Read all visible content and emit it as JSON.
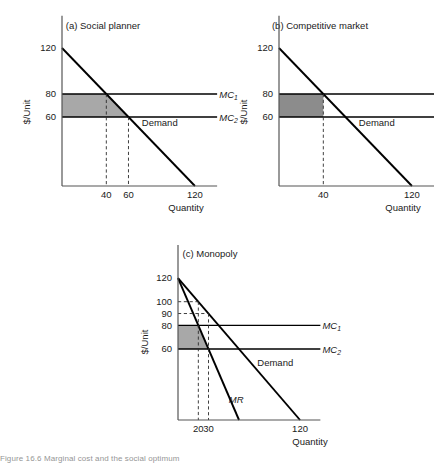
{
  "figure": {
    "caption_fragment": "Figure 16.6  Marginal cost and the social optimum"
  },
  "common": {
    "y_axis_title": "$/Unit",
    "x_axis_title": "Quantity",
    "label_mc1": "MC",
    "label_mc1_sub": "1",
    "label_mc2": "MC",
    "label_mc2_sub": "2",
    "label_demand": "Demand",
    "label_mr": "MR"
  },
  "chart_data": [
    {
      "id": "a",
      "type": "line",
      "title": "(a) Social planner",
      "xlabel": "Quantity",
      "ylabel": "$/Unit",
      "xlim": [
        0,
        140
      ],
      "ylim": [
        0,
        140
      ],
      "x_ticks": [
        40,
        60,
        120
      ],
      "x_tick_labels": [
        "40",
        "60",
        "120"
      ],
      "y_ticks": [
        60,
        80,
        120
      ],
      "y_tick_labels": [
        "60",
        "80",
        "120"
      ],
      "grid": false,
      "legend": "inline-labels",
      "series": [
        {
          "name": "Demand",
          "type": "line",
          "points": [
            [
              0,
              120
            ],
            [
              120,
              0
            ]
          ],
          "label": "Demand",
          "label_at": [
            72,
            52
          ]
        },
        {
          "name": "MC1",
          "type": "horizontal-line",
          "value": 80,
          "x_from": 0,
          "x_to": 140,
          "label": "MC1",
          "label_at": [
            142,
            80
          ]
        },
        {
          "name": "MC2",
          "type": "horizontal-line",
          "value": 60,
          "x_from": 0,
          "x_to": 140,
          "label": "MC2",
          "label_at": [
            142,
            60
          ]
        }
      ],
      "shaded_region": {
        "description": "Deadweight/benefit area between MC1 and MC2 bounded by demand",
        "fill": "#a8a8a8",
        "vertices": [
          [
            0,
            80
          ],
          [
            40,
            80
          ],
          [
            60,
            60
          ],
          [
            0,
            60
          ]
        ]
      },
      "dashed_drops": [
        {
          "x": 40,
          "from_y": 80,
          "to_y": 0
        },
        {
          "x": 60,
          "from_y": 60,
          "to_y": 0
        }
      ]
    },
    {
      "id": "b",
      "type": "line",
      "title": "(b) Competitive market",
      "xlabel": "Quantity",
      "ylabel": "$/Unit",
      "xlim": [
        0,
        140
      ],
      "ylim": [
        0,
        140
      ],
      "x_ticks": [
        40,
        120
      ],
      "x_tick_labels": [
        "40",
        "120"
      ],
      "y_ticks": [
        60,
        80,
        120
      ],
      "y_tick_labels": [
        "60",
        "80",
        "120"
      ],
      "grid": false,
      "legend": "inline-labels",
      "series": [
        {
          "name": "Demand",
          "type": "line",
          "points": [
            [
              0,
              120
            ],
            [
              120,
              0
            ]
          ],
          "label": "Demand",
          "label_at": [
            72,
            52
          ]
        },
        {
          "name": "MC1",
          "type": "horizontal-line",
          "value": 80,
          "x_from": 0,
          "x_to": 140,
          "label": "MC1",
          "label_at": [
            142,
            80
          ]
        },
        {
          "name": "MC2",
          "type": "horizontal-line",
          "value": 60,
          "x_from": 0,
          "x_to": 140,
          "label": "MC2",
          "label_at": [
            142,
            60
          ]
        }
      ],
      "shaded_region": {
        "description": "Producer cost-saving rectangle at competitive quantity 40",
        "fill": "#8c8c8c",
        "vertices": [
          [
            0,
            80
          ],
          [
            40,
            80
          ],
          [
            40,
            60
          ],
          [
            0,
            60
          ]
        ]
      },
      "dashed_drops": [
        {
          "x": 40,
          "from_y": 80,
          "to_y": 0
        }
      ]
    },
    {
      "id": "c",
      "type": "line",
      "title": "(c) Monopoly",
      "xlabel": "Quantity",
      "ylabel": "$/Unit",
      "xlim": [
        0,
        140
      ],
      "ylim": [
        0,
        140
      ],
      "x_ticks": [
        20,
        30,
        120
      ],
      "x_tick_labels": [
        "20",
        "30",
        "120"
      ],
      "y_ticks": [
        60,
        80,
        90,
        100,
        120
      ],
      "y_tick_labels": [
        "60",
        "80",
        "90",
        "100",
        "120"
      ],
      "grid": false,
      "legend": "inline-labels",
      "series": [
        {
          "name": "Demand",
          "type": "line",
          "points": [
            [
              0,
              120
            ],
            [
              120,
              0
            ]
          ],
          "label": "Demand",
          "label_at": [
            78,
            46
          ]
        },
        {
          "name": "MR",
          "type": "line",
          "points": [
            [
              0,
              120
            ],
            [
              60,
              0
            ]
          ],
          "label": "MR",
          "label_at": [
            50,
            14
          ]
        },
        {
          "name": "MC1",
          "type": "horizontal-line",
          "value": 80,
          "x_from": 0,
          "x_to": 140,
          "label": "MC1",
          "label_at": [
            142,
            80
          ]
        },
        {
          "name": "MC2",
          "type": "horizontal-line",
          "value": 60,
          "x_from": 0,
          "x_to": 140,
          "label": "MC2",
          "label_at": [
            142,
            60
          ]
        }
      ],
      "shaded_region": {
        "description": "Monopoly area between MC1 and MC2 bounded by MR",
        "fill": "#a8a8a8",
        "vertices": [
          [
            0,
            80
          ],
          [
            20,
            80
          ],
          [
            30,
            60
          ],
          [
            0,
            60
          ]
        ]
      },
      "dashed_drops": [
        {
          "x": 20,
          "from_y": 100,
          "to_y": 0
        },
        {
          "x": 30,
          "from_y": 90,
          "to_y": 0
        }
      ],
      "dashed_levels": [
        {
          "y": 100,
          "x_from": 0,
          "x_to": 20
        },
        {
          "y": 90,
          "x_from": 0,
          "x_to": 30
        }
      ]
    }
  ]
}
